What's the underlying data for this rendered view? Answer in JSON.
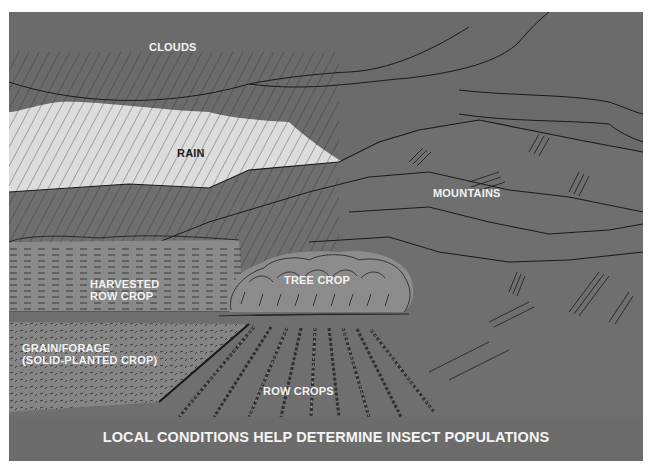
{
  "figure": {
    "caption": "LOCAL CONDITIONS HELP DETERMINE INSECT POPULATIONS",
    "labels": {
      "clouds": "CLOUDS",
      "rain": "RAIN",
      "mountains": "MOUNTAINS",
      "harvested_row_crop_line1": "HARVESTED",
      "harvested_row_crop_line2": "ROW CROP",
      "tree_crop": "TREE CROP",
      "grain_forage_line1": "GRAIN/FORAGE",
      "grain_forage_line2": "(SOLID-PLANTED CROP)",
      "row_crops": "ROW CROPS"
    },
    "colors": {
      "cloud": "#6b6b6b",
      "sky_rain_band": "#dcdcdc",
      "mountain": "#6f6f6f",
      "harvested_field": "#8a8a8a",
      "grain_field": "#858585",
      "tree_crop": "#8c8c8c",
      "foreground": "#6c6c6c",
      "ink": "#1a1a1a",
      "label_text": "#f2f2f2"
    }
  }
}
